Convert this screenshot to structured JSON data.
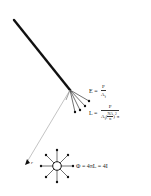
{
  "diagram": {
    "fiber": {
      "color": "#111111",
      "from": [
        14,
        20
      ],
      "to": [
        70,
        90
      ]
    },
    "fan_ray_count": 4,
    "source_ray_count": 8,
    "colors": {
      "ink": "#111111",
      "guide_line": "#9a9a9a",
      "background": "#ffffff"
    }
  },
  "labels": {
    "E_formula": {
      "lhs": "E =",
      "num": "P",
      "den_base": "A",
      "den_sub": "f"
    },
    "L_formula": {
      "lhs": "L =",
      "num": "P",
      "den_base": "A",
      "den_sub": "f",
      "den_paren_num": "NA",
      "den_paren_den": "n",
      "den_exp": "2",
      "den_tail": "π"
    },
    "r_label": "r",
    "phi_formula": "Φ = 4πL = 4I"
  }
}
